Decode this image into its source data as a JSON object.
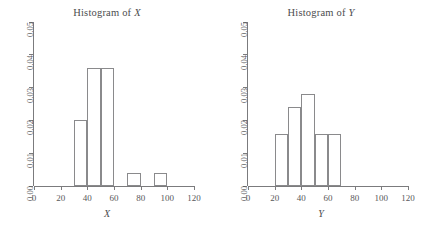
{
  "charts": [
    {
      "title_prefix": "Histogram of ",
      "title_var": "X",
      "xlabel": "X",
      "x_ticks": [
        "0",
        "20",
        "40",
        "60",
        "80",
        "100",
        "120"
      ],
      "y_ticks": [
        "0.00",
        "0.01",
        "0.02",
        "0.03",
        "0.04",
        "0.05"
      ]
    },
    {
      "title_prefix": "Histogram of ",
      "title_var": "Y",
      "xlabel": "Y",
      "x_ticks": [
        "0",
        "20",
        "40",
        "60",
        "80",
        "100",
        "120"
      ],
      "y_ticks": [
        "0.00",
        "0.01",
        "0.02",
        "0.03",
        "0.04",
        "0.05"
      ]
    }
  ],
  "chart_data": [
    {
      "type": "bar",
      "title": "Histogram of X",
      "xlabel": "X",
      "ylabel": "",
      "xlim": [
        0,
        120
      ],
      "ylim": [
        0,
        0.05
      ],
      "xticks": [
        0,
        20,
        40,
        60,
        80,
        100,
        120
      ],
      "yticks": [
        0.0,
        0.01,
        0.02,
        0.03,
        0.04,
        0.05
      ],
      "grid": false,
      "legend": "none",
      "bin_width": 10,
      "bins": [
        {
          "x0": 30,
          "x1": 40,
          "density": 0.02
        },
        {
          "x0": 40,
          "x1": 50,
          "density": 0.036
        },
        {
          "x0": 50,
          "x1": 60,
          "density": 0.036
        },
        {
          "x0": 70,
          "x1": 80,
          "density": 0.004
        },
        {
          "x0": 90,
          "x1": 100,
          "density": 0.004
        }
      ]
    },
    {
      "type": "bar",
      "title": "Histogram of Y",
      "xlabel": "Y",
      "ylabel": "",
      "xlim": [
        0,
        120
      ],
      "ylim": [
        0,
        0.05
      ],
      "xticks": [
        0,
        20,
        40,
        60,
        80,
        100,
        120
      ],
      "yticks": [
        0.0,
        0.01,
        0.02,
        0.03,
        0.04,
        0.05
      ],
      "grid": false,
      "legend": "none",
      "bin_width": 10,
      "bins": [
        {
          "x0": 20,
          "x1": 30,
          "density": 0.016
        },
        {
          "x0": 30,
          "x1": 40,
          "density": 0.024
        },
        {
          "x0": 40,
          "x1": 50,
          "density": 0.028
        },
        {
          "x0": 50,
          "x1": 60,
          "density": 0.016
        },
        {
          "x0": 60,
          "x1": 70,
          "density": 0.016
        }
      ]
    }
  ],
  "colors": {
    "background": "#ffffff",
    "axis": "#7b7b7d",
    "bar_outline": "#8a8a8c",
    "text": "#58585a"
  }
}
